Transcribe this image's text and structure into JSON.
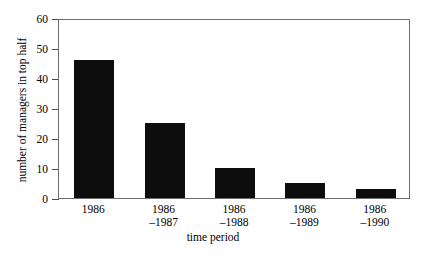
{
  "chart_data": {
    "type": "bar",
    "title": "",
    "xlabel": "time period",
    "ylabel": "number of managers in top half",
    "categories": [
      "1986",
      "1986\n–1987",
      "1986\n–1988",
      "1986\n–1989",
      "1986\n–1990"
    ],
    "category_lines": [
      {
        "line1": "1986",
        "line2": ""
      },
      {
        "line1": "1986",
        "line2": "–1987"
      },
      {
        "line1": "1986",
        "line2": "–1988"
      },
      {
        "line1": "1986",
        "line2": "–1989"
      },
      {
        "line1": "1986",
        "line2": "–1990"
      }
    ],
    "values": [
      46,
      25,
      10,
      5,
      3
    ],
    "ylim": [
      0,
      60
    ],
    "yticks": [
      0,
      10,
      20,
      30,
      40,
      50,
      60
    ],
    "ytick_labels": [
      "0",
      "10",
      "20",
      "30",
      "40",
      "50",
      "60"
    ],
    "grid": false,
    "legend": null,
    "bar_color": "#0d0d0d",
    "frame_color": "#6e6e6e",
    "background": "#ffffff"
  }
}
